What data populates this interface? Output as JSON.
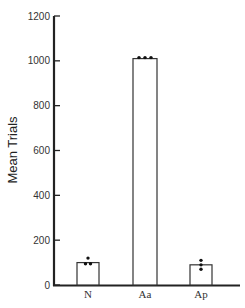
{
  "chart_data": {
    "type": "bar",
    "title": "",
    "xlabel": "",
    "ylabel": "Mean Trials",
    "ylim": [
      0,
      1200
    ],
    "yticks": [
      "0",
      "200",
      "400",
      "600",
      "800",
      "1000",
      "1200"
    ],
    "categories": [
      "N",
      "Aa",
      "Ap"
    ],
    "values": [
      100,
      1010,
      90
    ],
    "individual_points": {
      "N": [
        120,
        95,
        95
      ],
      "Aa": [
        1010,
        1010,
        1010
      ],
      "Ap": [
        110,
        90,
        70
      ]
    },
    "grid": false,
    "legend": null
  }
}
